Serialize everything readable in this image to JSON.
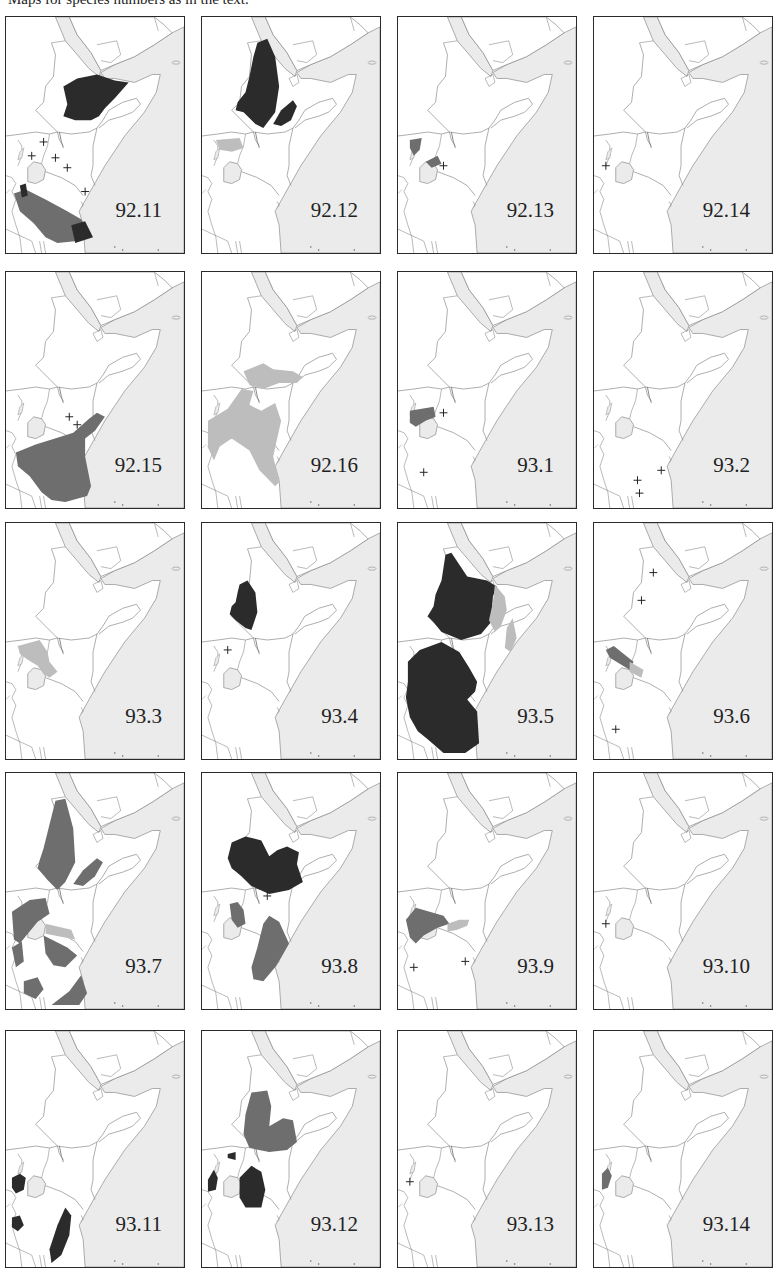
{
  "caption": "Maps for species numbers as in the text.",
  "colors": {
    "border": "#2a2a2a",
    "sea": "#ebebeb",
    "land": "#ffffff",
    "line": "#8a8a8a",
    "dark": "#2b2b2b",
    "medium": "#6e6e6e",
    "light": "#bdbdbd"
  },
  "legend_semantics": {
    "dark": "dense distribution range",
    "medium": "distribution range",
    "light": "marginal / uncertain range",
    "plus": "isolated record"
  },
  "panels": [
    {
      "id": "92.11",
      "row": 0,
      "col": 0,
      "shapes": [
        {
          "tone": "dark",
          "d": "M58,70 L72,62 L92,58 L110,64 L124,66 L110,82 L100,92 L94,100 L86,104 L70,104 L58,100 L62,88 Z"
        },
        {
          "tone": "medium",
          "d": "M8,178 L20,174 L40,184 L62,196 L76,204 L84,216 L72,226 L52,228 L40,222 L28,208 L14,196 Z"
        },
        {
          "tone": "dark",
          "d": "M14,170 L20,168 L22,180 L16,182 Z"
        },
        {
          "tone": "dark",
          "d": "M66,210 L80,206 L88,222 L70,228 Z"
        }
      ],
      "crosses": [
        [
          38,
          126
        ],
        [
          26,
          140
        ],
        [
          50,
          142
        ],
        [
          62,
          152
        ],
        [
          80,
          176
        ]
      ]
    },
    {
      "id": "92.12",
      "row": 0,
      "col": 1,
      "shapes": [
        {
          "tone": "dark",
          "d": "M56,26 L66,22 L74,40 L78,70 L74,96 L62,112 L54,108 L42,96 L34,94 L36,86 L44,76 L48,60 L52,40 Z"
        },
        {
          "tone": "dark",
          "d": "M72,108 L80,94 L92,84 L96,90 L90,104 L80,110 Z"
        },
        {
          "tone": "light",
          "d": "M14,124 L38,122 L42,132 L30,136 L18,134 Z"
        }
      ],
      "crosses": []
    },
    {
      "id": "92.13",
      "row": 0,
      "col": 2,
      "shapes": [
        {
          "tone": "medium",
          "d": "M12,124 L24,122 L22,134 L16,140 L12,132 Z"
        },
        {
          "tone": "medium",
          "d": "M28,146 L40,140 L44,148 L34,152 Z"
        }
      ],
      "crosses": [
        [
          46,
          150
        ]
      ]
    },
    {
      "id": "92.14",
      "row": 0,
      "col": 3,
      "shapes": [],
      "crosses": [
        [
          12,
          150
        ]
      ]
    },
    {
      "id": "92.15",
      "row": 1,
      "col": 0,
      "shapes": [
        {
          "tone": "medium",
          "d": "M10,182 L30,174 L56,166 L68,162 L84,148 L92,142 L100,146 L90,160 L80,168 L80,186 L86,216 L82,226 L60,232 L46,230 L36,222 L24,206 L12,196 Z"
        }
      ],
      "crosses": [
        [
          64,
          146
        ],
        [
          72,
          154
        ]
      ]
    },
    {
      "id": "92.16",
      "row": 1,
      "col": 1,
      "shapes": [
        {
          "tone": "light",
          "d": "M42,100 L62,92 L72,98 L92,100 L102,106 L96,112 L78,112 L62,118 L48,114 Z"
        },
        {
          "tone": "light",
          "d": "M6,150 L26,138 L40,118 L52,120 L48,134 L60,140 L74,132 L80,150 L76,168 L72,186 L78,212 L74,216 L58,200 L48,180 L30,168 L18,176 L12,190 L6,176 Z"
        }
      ],
      "crosses": []
    },
    {
      "id": "93.1",
      "row": 1,
      "col": 2,
      "shapes": [
        {
          "tone": "medium",
          "d": "M12,140 L36,136 L38,146 L28,150 L18,156 L12,152 Z"
        }
      ],
      "crosses": [
        [
          46,
          142
        ],
        [
          26,
          202
        ]
      ]
    },
    {
      "id": "93.2",
      "row": 1,
      "col": 3,
      "shapes": [],
      "crosses": [
        [
          68,
          200
        ],
        [
          44,
          210
        ],
        [
          46,
          223
        ]
      ]
    },
    {
      "id": "93.3",
      "row": 2,
      "col": 0,
      "shapes": [
        {
          "tone": "light",
          "d": "M12,124 L34,118 L42,130 L44,140 L52,150 L44,156 L38,152 L32,144 L22,138 L14,132 Z"
        }
      ],
      "crosses": []
    },
    {
      "id": "93.4",
      "row": 2,
      "col": 1,
      "shapes": [
        {
          "tone": "dark",
          "d": "M38,62 L46,58 L54,70 L56,90 L50,108 L44,106 L34,98 L28,92 L30,84 L34,80 L36,70 Z"
        }
      ],
      "crosses": [
        [
          26,
          128
        ]
      ]
    },
    {
      "id": "93.5",
      "row": 2,
      "col": 2,
      "shapes": [
        {
          "tone": "dark",
          "d": "M48,32 L54,30 L70,54 L90,58 L100,64 L96,74 L94,100 L84,112 L64,118 L44,110 L36,100 L30,94 L36,84 L38,72 L44,58 Z"
        },
        {
          "tone": "dark",
          "d": "M10,140 L22,128 L44,120 L62,130 L72,146 L80,160 L78,170 L70,178 L80,190 L82,222 L68,232 L46,232 L30,218 L20,210 L12,196 L8,176 L10,160 Z"
        },
        {
          "tone": "light",
          "d": "M98,62 L108,74 L110,88 L104,104 L98,110 L92,98 L96,80 Z"
        },
        {
          "tone": "light",
          "d": "M110,106 L116,96 L120,116 L114,130 L108,126 Z"
        }
      ],
      "crosses": []
    },
    {
      "id": "93.6",
      "row": 2,
      "col": 3,
      "shapes": [
        {
          "tone": "medium",
          "d": "M12,128 L20,124 L40,140 L36,148 L16,136 Z"
        },
        {
          "tone": "light",
          "d": "M36,140 L50,148 L48,156 L36,150 Z"
        }
      ],
      "crosses": [
        [
          60,
          50
        ],
        [
          48,
          78
        ],
        [
          22,
          208
        ]
      ]
    },
    {
      "id": "93.7",
      "row": 3,
      "col": 0,
      "shapes": [
        {
          "tone": "medium",
          "d": "M50,28 L60,26 L68,56 L70,90 L60,110 L52,118 L42,108 L32,96 L34,88 L38,76 L44,52 Z"
        },
        {
          "tone": "medium",
          "d": "M68,112 L78,98 L92,86 L98,90 L90,104 L78,114 Z"
        },
        {
          "tone": "medium",
          "d": "M6,140 L24,128 L40,126 L44,142 L32,150 L22,162 L14,172 L8,168 Z"
        },
        {
          "tone": "light",
          "d": "M40,152 L66,158 L70,168 L40,162 Z"
        },
        {
          "tone": "medium",
          "d": "M38,164 L62,176 L72,184 L60,196 L48,194 L40,182 Z"
        },
        {
          "tone": "medium",
          "d": "M6,176 L16,170 L18,190 L10,196 Z"
        },
        {
          "tone": "medium",
          "d": "M18,210 L32,206 L38,218 L30,228 L18,222 Z"
        },
        {
          "tone": "medium",
          "d": "M46,234 L64,220 L76,204 L82,222 L74,234 Z"
        }
      ],
      "crosses": []
    },
    {
      "id": "93.8",
      "row": 3,
      "col": 1,
      "shapes": [
        {
          "tone": "dark",
          "d": "M30,70 L44,64 L60,68 L68,84 L76,78 L86,74 L98,80 L96,92 L102,110 L88,118 L68,122 L50,114 L40,104 L30,96 L26,86 Z"
        },
        {
          "tone": "medium",
          "d": "M28,132 L36,130 L42,138 L44,152 L36,156 L30,148 Z"
        },
        {
          "tone": "medium",
          "d": "M62,152 L68,144 L78,150 L88,172 L80,186 L74,196 L62,210 L52,208 L50,196 L56,176 Z"
        }
      ],
      "crosses": [
        [
          66,
          124
        ]
      ]
    },
    {
      "id": "93.9",
      "row": 3,
      "col": 2,
      "shapes": [
        {
          "tone": "medium",
          "d": "M8,148 L18,136 L32,140 L46,144 L52,152 L40,156 L26,164 L18,172 L12,166 Z"
        },
        {
          "tone": "light",
          "d": "M50,152 L62,148 L72,148 L70,154 L60,158 L50,160 Z"
        }
      ],
      "crosses": [
        [
          16,
          196
        ],
        [
          68,
          190
        ]
      ]
    },
    {
      "id": "93.10",
      "row": 3,
      "col": 3,
      "shapes": [],
      "crosses": [
        [
          12,
          152
        ]
      ]
    },
    {
      "id": "93.11",
      "row": 4,
      "col": 0,
      "shapes": [
        {
          "tone": "dark",
          "d": "M6,148 L14,144 L20,148 L18,160 L10,164 L6,158 Z"
        },
        {
          "tone": "dark",
          "d": "M6,188 L14,186 L18,196 L12,202 L6,198 Z"
        },
        {
          "tone": "dark",
          "d": "M44,220 L52,196 L60,178 L66,186 L64,206 L56,226 L46,234 Z"
        }
      ],
      "crosses": []
    },
    {
      "id": "93.12",
      "row": 4,
      "col": 1,
      "shapes": [
        {
          "tone": "medium",
          "d": "M50,62 L66,60 L70,76 L68,96 L82,88 L92,90 L96,112 L86,120 L68,122 L48,118 L42,104 L44,84 Z"
        },
        {
          "tone": "dark",
          "d": "M26,124 L34,122 L34,130 L26,128 Z"
        },
        {
          "tone": "dark",
          "d": "M6,150 L12,140 L16,148 L14,160 L6,162 Z"
        },
        {
          "tone": "dark",
          "d": "M38,148 L50,136 L60,142 L64,160 L60,178 L44,178 L38,168 Z"
        }
      ],
      "crosses": []
    },
    {
      "id": "93.13",
      "row": 4,
      "col": 2,
      "shapes": [],
      "crosses": [
        [
          12,
          152
        ]
      ]
    },
    {
      "id": "93.14",
      "row": 4,
      "col": 3,
      "shapes": [
        {
          "tone": "medium",
          "d": "M8,144 L14,138 L18,146 L14,158 L8,160 Z"
        }
      ],
      "crosses": []
    }
  ],
  "layout": {
    "col_x": [
      5,
      201,
      397,
      593
    ],
    "row_y": [
      16,
      271,
      522,
      772,
      1030
    ]
  }
}
